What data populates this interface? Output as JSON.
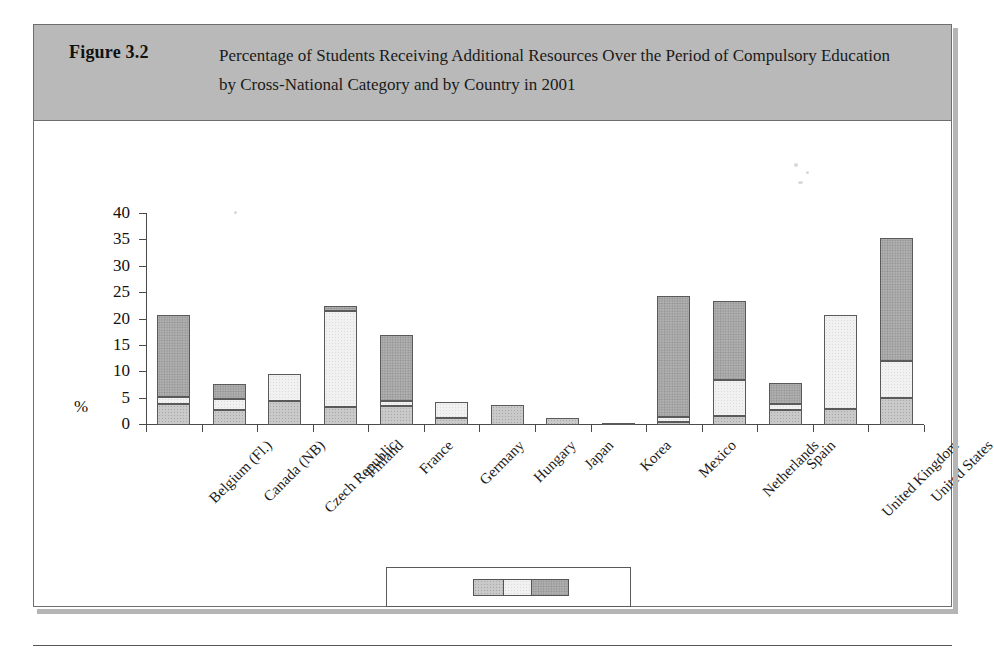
{
  "figure": {
    "number": "Figure 3.2",
    "title": "Percentage of Students Receiving Additional Resources Over the Period of Compulsory Education by Cross-National Category and by Country in 2001"
  },
  "chart_data": {
    "type": "bar",
    "subtype": "stacked",
    "title": "Percentage of Students Receiving Additional Resources Over the Period of Compulsory Education by Cross-National Category and by Country in 2001",
    "xlabel": "",
    "ylabel": "%",
    "ylim": [
      0,
      40
    ],
    "yticks": [
      0,
      5,
      10,
      15,
      20,
      25,
      30,
      35,
      40
    ],
    "grid": false,
    "legend_position": "bottom",
    "categories": [
      "Belgium (Fl.)",
      "Canada (NB)",
      "Czech Republic",
      "Finland",
      "France",
      "Germany",
      "Hungary",
      "Japan",
      "Korea",
      "Mexico",
      "Netherlands",
      "Spain",
      "United Kingdom",
      "United States"
    ],
    "series": [
      {
        "name": "A",
        "color": "#c9c9c9",
        "values": [
          3.9,
          2.8,
          4.5,
          3.4,
          3.6,
          1.4,
          3.8,
          1.4,
          0.4,
          0.6,
          1.7,
          2.9,
          3.0,
          5.1
        ]
      },
      {
        "name": "B",
        "color": "#f1f1f1",
        "values": [
          1.4,
          2.2,
          5.2,
          18.3,
          1.0,
          2.9,
          0.0,
          0.0,
          0.0,
          0.9,
          6.9,
          1.0,
          17.9,
          7.1
        ]
      },
      {
        "name": "C",
        "color": "#b0b0b0",
        "values": [
          15.5,
          2.7,
          0.0,
          0.8,
          12.5,
          0.0,
          0.0,
          0.0,
          0.0,
          23.0,
          14.9,
          4.1,
          0.0,
          23.2
        ]
      }
    ],
    "totals": [
      20.8,
      7.7,
      9.7,
      22.5,
      17.1,
      4.3,
      3.8,
      1.4,
      0.4,
      24.5,
      23.5,
      8.0,
      20.9,
      35.4
    ]
  },
  "legend": {
    "items": [
      {
        "label": "A",
        "color": "#c9c9c9"
      },
      {
        "label": "B",
        "color": "#f1f1f1"
      },
      {
        "label": "C",
        "color": "#b0b0b0"
      }
    ]
  }
}
